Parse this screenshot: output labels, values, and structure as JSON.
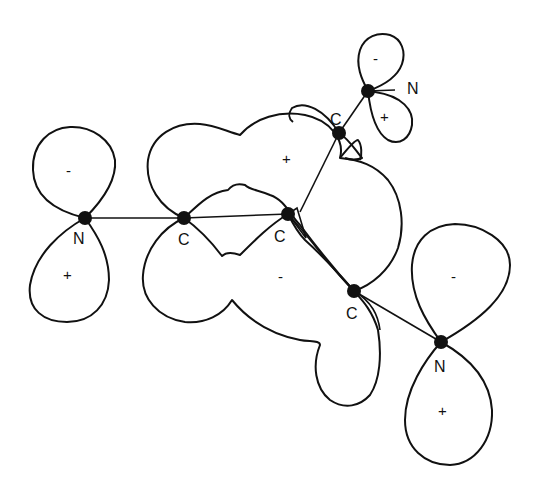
{
  "diagram": {
    "title": "",
    "atoms": [
      {
        "id": "N1",
        "label": "N",
        "x": 85,
        "y": 218
      },
      {
        "id": "C1",
        "label": "C",
        "x": 184,
        "y": 218
      },
      {
        "id": "C2",
        "label": "C",
        "x": 288,
        "y": 214
      },
      {
        "id": "C3",
        "label": "C",
        "x": 354,
        "y": 291
      },
      {
        "id": "N2",
        "label": "N",
        "x": 441,
        "y": 342
      },
      {
        "id": "C4",
        "label": "C",
        "x": 339,
        "y": 133
      },
      {
        "id": "N3",
        "label": "N",
        "x": 368,
        "y": 91
      }
    ],
    "signs": [
      {
        "id": "n1-upper",
        "text": "-",
        "x": 70,
        "y": 173
      },
      {
        "id": "n1-lower",
        "text": "+",
        "x": 68,
        "y": 278
      },
      {
        "id": "pi-upper",
        "text": "+",
        "x": 287,
        "y": 160
      },
      {
        "id": "pi-lower",
        "text": "-",
        "x": 282,
        "y": 279
      },
      {
        "id": "n3-upper",
        "text": "-",
        "x": 377,
        "y": 60
      },
      {
        "id": "n3-lower",
        "text": "+",
        "x": 385,
        "y": 118
      },
      {
        "id": "n2-upper",
        "text": "-",
        "x": 455,
        "y": 279
      },
      {
        "id": "n2-lower",
        "text": "+",
        "x": 443,
        "y": 412
      }
    ],
    "labels": {
      "N1": "N",
      "C1": "C",
      "C2": "C",
      "C3": "C",
      "N2": "N",
      "C4": "C",
      "N3": "N"
    },
    "colors": {
      "stroke": "#111111",
      "background": "#ffffff"
    }
  }
}
